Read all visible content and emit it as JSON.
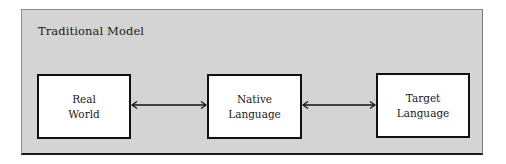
{
  "diagram": {
    "title": "Traditional Model",
    "nodes": [
      {
        "id": "real-world",
        "line1": "Real",
        "line2": "World"
      },
      {
        "id": "native-language",
        "line1": "Native",
        "line2": "Language"
      },
      {
        "id": "target-language",
        "line1": "Target",
        "line2": "Language"
      }
    ],
    "edges": [
      {
        "from": "real-world",
        "to": "native-language",
        "type": "bidirectional-arrow"
      },
      {
        "from": "native-language",
        "to": "target-language",
        "type": "bidirectional-arrow"
      }
    ],
    "colors": {
      "panel_bg": "#d4d4d4",
      "box_bg": "#ffffff",
      "stroke": "#111111"
    }
  }
}
